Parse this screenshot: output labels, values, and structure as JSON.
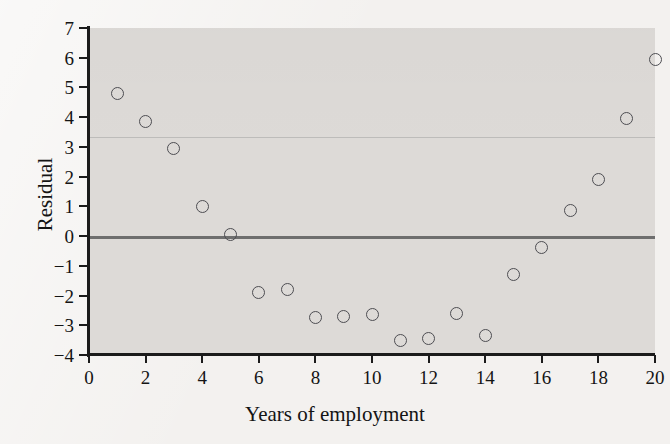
{
  "figure": {
    "background_color": "#f3f1ef",
    "panel_color": "#dddad7",
    "marker_color": "#4d4d52",
    "zero_line_color": "#6e6e6e",
    "axis_color": "#1b1b1b"
  },
  "chart_data": {
    "type": "scatter",
    "title": "",
    "xlabel": "Years of employment",
    "ylabel": "Residual",
    "xlim": [
      0,
      20
    ],
    "ylim": [
      -4,
      7
    ],
    "xticks": [
      0,
      2,
      4,
      6,
      8,
      10,
      12,
      14,
      16,
      18,
      20
    ],
    "xtick_labels": [
      "0",
      "2",
      "4",
      "6",
      "8",
      "10",
      "12",
      "14",
      "16",
      "18",
      "20"
    ],
    "yticks": [
      -4,
      -3,
      -2,
      -1,
      0,
      1,
      2,
      3,
      4,
      5,
      6,
      7
    ],
    "ytick_labels": [
      "−4",
      "−3",
      "−2",
      "−1",
      "0",
      "1",
      "2",
      "3",
      "4",
      "5",
      "6",
      "7"
    ],
    "grid": false,
    "legend": null,
    "reference_lines": [
      {
        "name": "zero-line",
        "y": 0,
        "color": "#6e6e6e"
      },
      {
        "name": "faint-line",
        "y": 3.35,
        "color": "#9a9a9a"
      }
    ],
    "marker": "open-circle",
    "x": [
      1,
      2,
      3,
      4,
      5,
      6,
      7,
      8,
      9,
      10,
      11,
      12,
      13,
      14,
      15,
      16,
      17,
      18,
      19,
      20
    ],
    "y": [
      4.8,
      3.85,
      2.95,
      1.0,
      0.05,
      -1.9,
      -1.8,
      -2.75,
      -2.7,
      -2.65,
      -3.5,
      -3.45,
      -2.6,
      -3.35,
      -1.3,
      -0.4,
      0.85,
      1.9,
      3.95,
      5.95
    ],
    "points": [
      {
        "x": 1,
        "y": 4.8
      },
      {
        "x": 2,
        "y": 3.85
      },
      {
        "x": 3,
        "y": 2.95
      },
      {
        "x": 4,
        "y": 1.0
      },
      {
        "x": 5,
        "y": 0.05
      },
      {
        "x": 6,
        "y": -1.9
      },
      {
        "x": 7,
        "y": -1.8
      },
      {
        "x": 8,
        "y": -2.75
      },
      {
        "x": 9,
        "y": -2.7
      },
      {
        "x": 10,
        "y": -2.65
      },
      {
        "x": 11,
        "y": -3.5
      },
      {
        "x": 12,
        "y": -3.45
      },
      {
        "x": 13,
        "y": -2.6
      },
      {
        "x": 14,
        "y": -3.35
      },
      {
        "x": 15,
        "y": -1.3
      },
      {
        "x": 16,
        "y": -0.4
      },
      {
        "x": 17,
        "y": 0.85
      },
      {
        "x": 18,
        "y": 1.9
      },
      {
        "x": 19,
        "y": 3.95
      },
      {
        "x": 20,
        "y": 5.95
      }
    ]
  }
}
